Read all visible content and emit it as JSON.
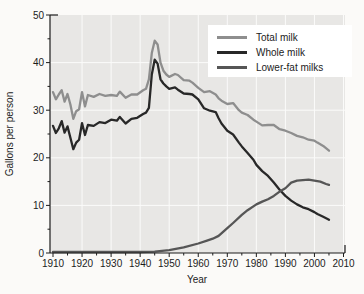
{
  "chart_data": {
    "type": "line",
    "title": "",
    "xlabel": "Year",
    "ylabel": "Gallons per person",
    "xlim": [
      1910,
      2010
    ],
    "ylim": [
      0,
      50
    ],
    "x_ticks": [
      1910,
      1920,
      1930,
      1940,
      1950,
      1960,
      1970,
      1980,
      1990,
      2000,
      2010
    ],
    "y_ticks": [
      0,
      10,
      20,
      30,
      40,
      50
    ],
    "x_minor_step": 5,
    "y_minor_step": 5,
    "grid": true,
    "legend_position": "top-right",
    "plot_bg_color": "#e8e7e5",
    "grid_color": "#fbfbfa",
    "axis_color": "#1c1c1c",
    "series": [
      {
        "name": "Total milk",
        "color": "#8e8e8e",
        "points": [
          [
            1910,
            33.8
          ],
          [
            1911,
            32.3
          ],
          [
            1912,
            33.3
          ],
          [
            1913,
            34.2
          ],
          [
            1914,
            31.8
          ],
          [
            1915,
            33.4
          ],
          [
            1916,
            31.2
          ],
          [
            1917,
            28.2
          ],
          [
            1918,
            29.8
          ],
          [
            1919,
            30.2
          ],
          [
            1920,
            33.8
          ],
          [
            1921,
            30.8
          ],
          [
            1922,
            33.2
          ],
          [
            1924,
            32.8
          ],
          [
            1926,
            33.4
          ],
          [
            1928,
            33.0
          ],
          [
            1930,
            33.2
          ],
          [
            1932,
            33.0
          ],
          [
            1933,
            33.9
          ],
          [
            1935,
            32.6
          ],
          [
            1937,
            33.3
          ],
          [
            1939,
            33.3
          ],
          [
            1941,
            34.2
          ],
          [
            1942,
            34.5
          ],
          [
            1943,
            36.5
          ],
          [
            1944,
            42.0
          ],
          [
            1945,
            44.6
          ],
          [
            1946,
            43.8
          ],
          [
            1947,
            40.0
          ],
          [
            1948,
            38.3
          ],
          [
            1949,
            37.5
          ],
          [
            1950,
            37.0
          ],
          [
            1952,
            37.6
          ],
          [
            1953,
            37.4
          ],
          [
            1955,
            36.3
          ],
          [
            1957,
            36.2
          ],
          [
            1958,
            35.8
          ],
          [
            1960,
            34.7
          ],
          [
            1962,
            33.8
          ],
          [
            1964,
            34.0
          ],
          [
            1966,
            33.3
          ],
          [
            1967,
            32.5
          ],
          [
            1968,
            32.0
          ],
          [
            1970,
            31.3
          ],
          [
            1972,
            31.5
          ],
          [
            1974,
            30.0
          ],
          [
            1975,
            29.5
          ],
          [
            1977,
            29.0
          ],
          [
            1979,
            28.0
          ],
          [
            1980,
            27.6
          ],
          [
            1982,
            26.8
          ],
          [
            1984,
            26.9
          ],
          [
            1986,
            26.9
          ],
          [
            1988,
            26.0
          ],
          [
            1990,
            25.7
          ],
          [
            1992,
            25.2
          ],
          [
            1994,
            24.6
          ],
          [
            1996,
            24.3
          ],
          [
            1998,
            23.8
          ],
          [
            2000,
            23.6
          ],
          [
            2001,
            23.2
          ],
          [
            2003,
            22.5
          ],
          [
            2005,
            21.5
          ]
        ]
      },
      {
        "name": "Whole milk",
        "color": "#282828",
        "points": [
          [
            1910,
            26.7
          ],
          [
            1911,
            25.2
          ],
          [
            1912,
            26.2
          ],
          [
            1913,
            27.7
          ],
          [
            1914,
            25.3
          ],
          [
            1915,
            26.6
          ],
          [
            1916,
            24.2
          ],
          [
            1917,
            21.8
          ],
          [
            1918,
            23.2
          ],
          [
            1919,
            23.8
          ],
          [
            1920,
            27.3
          ],
          [
            1921,
            24.8
          ],
          [
            1922,
            26.9
          ],
          [
            1924,
            26.7
          ],
          [
            1926,
            27.5
          ],
          [
            1928,
            27.3
          ],
          [
            1930,
            28.0
          ],
          [
            1932,
            27.8
          ],
          [
            1933,
            28.6
          ],
          [
            1935,
            27.2
          ],
          [
            1937,
            28.2
          ],
          [
            1939,
            28.4
          ],
          [
            1941,
            29.2
          ],
          [
            1942,
            29.5
          ],
          [
            1943,
            30.5
          ],
          [
            1944,
            37.5
          ],
          [
            1945,
            40.6
          ],
          [
            1946,
            39.8
          ],
          [
            1947,
            36.5
          ],
          [
            1948,
            35.6
          ],
          [
            1949,
            35.0
          ],
          [
            1950,
            34.5
          ],
          [
            1952,
            34.8
          ],
          [
            1953,
            34.3
          ],
          [
            1955,
            33.5
          ],
          [
            1957,
            33.4
          ],
          [
            1958,
            33.3
          ],
          [
            1960,
            32.3
          ],
          [
            1962,
            30.4
          ],
          [
            1964,
            29.9
          ],
          [
            1966,
            29.6
          ],
          [
            1967,
            28.3
          ],
          [
            1968,
            27.2
          ],
          [
            1970,
            25.7
          ],
          [
            1972,
            24.9
          ],
          [
            1974,
            23.2
          ],
          [
            1975,
            22.4
          ],
          [
            1977,
            21.0
          ],
          [
            1979,
            19.6
          ],
          [
            1980,
            18.5
          ],
          [
            1982,
            17.2
          ],
          [
            1984,
            16.2
          ],
          [
            1986,
            14.8
          ],
          [
            1988,
            13.3
          ],
          [
            1990,
            12.0
          ],
          [
            1992,
            11.0
          ],
          [
            1994,
            10.2
          ],
          [
            1996,
            9.6
          ],
          [
            1998,
            9.2
          ],
          [
            2000,
            8.6
          ],
          [
            2001,
            8.2
          ],
          [
            2003,
            7.6
          ],
          [
            2005,
            7.0
          ]
        ]
      },
      {
        "name": "Lower-fat milks",
        "color": "#565656",
        "points": [
          [
            1910,
            0.2
          ],
          [
            1920,
            0.2
          ],
          [
            1930,
            0.2
          ],
          [
            1940,
            0.2
          ],
          [
            1945,
            0.3
          ],
          [
            1950,
            0.6
          ],
          [
            1955,
            1.2
          ],
          [
            1960,
            2.0
          ],
          [
            1963,
            2.6
          ],
          [
            1965,
            3.0
          ],
          [
            1967,
            3.6
          ],
          [
            1970,
            5.2
          ],
          [
            1972,
            6.3
          ],
          [
            1975,
            8.0
          ],
          [
            1977,
            9.0
          ],
          [
            1980,
            10.2
          ],
          [
            1982,
            10.8
          ],
          [
            1984,
            11.3
          ],
          [
            1986,
            12.0
          ],
          [
            1988,
            12.9
          ],
          [
            1990,
            13.6
          ],
          [
            1992,
            14.8
          ],
          [
            1994,
            15.2
          ],
          [
            1996,
            15.3
          ],
          [
            1998,
            15.4
          ],
          [
            2000,
            15.2
          ],
          [
            2002,
            15.0
          ],
          [
            2004,
            14.5
          ],
          [
            2005,
            14.3
          ]
        ]
      }
    ]
  }
}
